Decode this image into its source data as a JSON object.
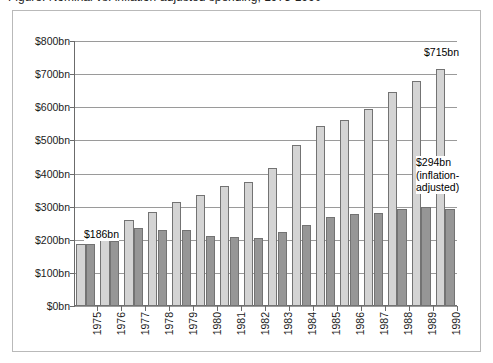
{
  "figure": {
    "clipped_title": "Figure: Nominal vs. inflation-adjusted spending, 1975-1990"
  },
  "chart_data": {
    "type": "bar",
    "title": "",
    "xlabel": "",
    "ylabel": "",
    "ylim": [
      0,
      800
    ],
    "yticks": [
      0,
      100,
      200,
      300,
      400,
      500,
      600,
      700,
      800
    ],
    "ytick_labels": [
      "$0bn",
      "$100bn",
      "$200bn",
      "$300bn",
      "$400bn",
      "$500bn",
      "$600bn",
      "$700bn",
      "$800bn"
    ],
    "grid": true,
    "legend": "none",
    "categories": [
      "1975",
      "1976",
      "1977",
      "1978",
      "1979",
      "1980",
      "1981",
      "1982",
      "1983",
      "1984",
      "1985",
      "1986",
      "1987",
      "1988",
      "1989",
      "1990"
    ],
    "series": [
      {
        "name": "Nominal",
        "color": "#d4d4d4",
        "values": [
          186,
          215,
          261,
          284,
          313,
          336,
          363,
          375,
          417,
          485,
          544,
          563,
          595,
          645,
          679,
          715
        ]
      },
      {
        "name": "Inflation-adjusted",
        "color": "#969696",
        "values": [
          186,
          197,
          237,
          229,
          229,
          211,
          208,
          204,
          223,
          246,
          269,
          277,
          281,
          292,
          300,
          294
        ]
      }
    ],
    "annotations": [
      {
        "id": "first-value",
        "text": "$186bn",
        "category": "1975"
      },
      {
        "id": "last-nominal",
        "text": "$715bn",
        "category": "1990"
      },
      {
        "id": "last-adjusted-line1",
        "text": "$294bn",
        "category": "1990"
      },
      {
        "id": "last-adjusted-line2",
        "text": "(inflation-",
        "category": "1990"
      },
      {
        "id": "last-adjusted-line3",
        "text": "adjusted)",
        "category": "1990"
      }
    ]
  }
}
